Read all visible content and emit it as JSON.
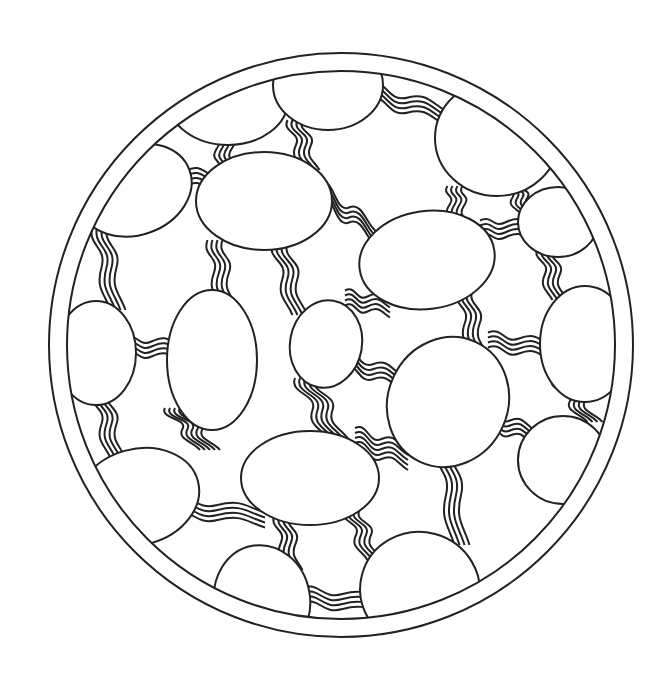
{
  "artwork": {
    "type": "coloring-page",
    "subject": "circular mandala of ovals connected by wavy line bundles",
    "stroke_color": "#222222",
    "background_color": "#ffffff",
    "stroke_width": 2,
    "center": [
      341,
      345
    ],
    "outer_ring_radius": 292,
    "inner_ring_radius": 274
  },
  "ovals": [
    {
      "cx": 228,
      "cy": 100,
      "rx": 60,
      "ry": 45,
      "rot": 0
    },
    {
      "cx": 328,
      "cy": 85,
      "rx": 55,
      "ry": 45,
      "rot": 0
    },
    {
      "cx": 497,
      "cy": 138,
      "rx": 62,
      "ry": 58,
      "rot": 0
    },
    {
      "cx": 135,
      "cy": 190,
      "rx": 58,
      "ry": 45,
      "rot": -20
    },
    {
      "cx": 264,
      "cy": 201,
      "rx": 68,
      "ry": 49,
      "rot": 0
    },
    {
      "cx": 427,
      "cy": 260,
      "rx": 68,
      "ry": 49,
      "rot": -8
    },
    {
      "cx": 558,
      "cy": 222,
      "rx": 40,
      "ry": 35,
      "rot": 0
    },
    {
      "cx": 96,
      "cy": 353,
      "rx": 40,
      "ry": 52,
      "rot": 0
    },
    {
      "cx": 212,
      "cy": 360,
      "rx": 45,
      "ry": 70,
      "rot": 0
    },
    {
      "cx": 326,
      "cy": 344,
      "rx": 36,
      "ry": 44,
      "rot": 10
    },
    {
      "cx": 448,
      "cy": 402,
      "rx": 60,
      "ry": 66,
      "rot": 25
    },
    {
      "cx": 585,
      "cy": 344,
      "rx": 45,
      "ry": 58,
      "rot": 0
    },
    {
      "cx": 138,
      "cy": 497,
      "rx": 62,
      "ry": 48,
      "rot": -15
    },
    {
      "cx": 310,
      "cy": 478,
      "rx": 69,
      "ry": 47,
      "rot": 0
    },
    {
      "cx": 563,
      "cy": 460,
      "rx": 45,
      "ry": 44,
      "rot": 0
    },
    {
      "cx": 262,
      "cy": 600,
      "rx": 48,
      "ry": 55,
      "rot": -10
    },
    {
      "cx": 420,
      "cy": 590,
      "rx": 60,
      "ry": 58,
      "rot": 15
    }
  ],
  "bundles": [
    {
      "x1": 262,
      "y1": 88,
      "x2": 280,
      "y2": 82,
      "count": 4,
      "dir": "h"
    },
    {
      "x1": 376,
      "y1": 90,
      "x2": 440,
      "y2": 120,
      "count": 4,
      "dir": "h"
    },
    {
      "x1": 222,
      "y1": 140,
      "x2": 228,
      "y2": 155,
      "count": 4,
      "dir": "v"
    },
    {
      "x1": 295,
      "y1": 130,
      "x2": 312,
      "y2": 160,
      "count": 4,
      "dir": "v"
    },
    {
      "x1": 170,
      "y1": 175,
      "x2": 200,
      "y2": 182,
      "count": 4,
      "dir": "h"
    },
    {
      "x1": 330,
      "y1": 190,
      "x2": 368,
      "y2": 240,
      "count": 4,
      "dir": "h"
    },
    {
      "x1": 510,
      "y1": 190,
      "x2": 530,
      "y2": 205,
      "count": 4,
      "dir": "v"
    },
    {
      "x1": 455,
      "y1": 196,
      "x2": 460,
      "y2": 212,
      "count": 4,
      "dir": "v"
    },
    {
      "x1": 490,
      "y1": 228,
      "x2": 520,
      "y2": 232,
      "count": 4,
      "dir": "h"
    },
    {
      "x1": 100,
      "y1": 235,
      "x2": 118,
      "y2": 300,
      "count": 4,
      "dir": "v"
    },
    {
      "x1": 215,
      "y1": 250,
      "x2": 228,
      "y2": 295,
      "count": 4,
      "dir": "v"
    },
    {
      "x1": 280,
      "y1": 252,
      "x2": 300,
      "y2": 305,
      "count": 4,
      "dir": "v"
    },
    {
      "x1": 545,
      "y1": 258,
      "x2": 560,
      "y2": 290,
      "count": 4,
      "dir": "v"
    },
    {
      "x1": 355,
      "y1": 298,
      "x2": 380,
      "y2": 310,
      "count": 4,
      "dir": "h"
    },
    {
      "x1": 465,
      "y1": 300,
      "x2": 480,
      "y2": 345,
      "count": 4,
      "dir": "v"
    },
    {
      "x1": 135,
      "y1": 346,
      "x2": 168,
      "y2": 352,
      "count": 4,
      "dir": "h"
    },
    {
      "x1": 498,
      "y1": 340,
      "x2": 540,
      "y2": 352,
      "count": 4,
      "dir": "h"
    },
    {
      "x1": 352,
      "y1": 358,
      "x2": 395,
      "y2": 385,
      "count": 4,
      "dir": "h"
    },
    {
      "x1": 100,
      "y1": 400,
      "x2": 118,
      "y2": 448,
      "count": 4,
      "dir": "v"
    },
    {
      "x1": 175,
      "y1": 418,
      "x2": 210,
      "y2": 440,
      "count": 5,
      "dir": "v"
    },
    {
      "x1": 305,
      "y1": 388,
      "x2": 340,
      "y2": 432,
      "count": 5,
      "dir": "v"
    },
    {
      "x1": 560,
      "y1": 390,
      "x2": 595,
      "y2": 412,
      "count": 4,
      "dir": "v"
    },
    {
      "x1": 365,
      "y1": 438,
      "x2": 398,
      "y2": 460,
      "count": 5,
      "dir": "h"
    },
    {
      "x1": 495,
      "y1": 418,
      "x2": 525,
      "y2": 438,
      "count": 4,
      "dir": "h"
    },
    {
      "x1": 180,
      "y1": 505,
      "x2": 255,
      "y2": 520,
      "count": 4,
      "dir": "h"
    },
    {
      "x1": 445,
      "y1": 455,
      "x2": 462,
      "y2": 535,
      "count": 4,
      "dir": "v"
    },
    {
      "x1": 282,
      "y1": 525,
      "x2": 295,
      "y2": 560,
      "count": 4,
      "dir": "v"
    },
    {
      "x1": 352,
      "y1": 520,
      "x2": 375,
      "y2": 550,
      "count": 4,
      "dir": "v"
    },
    {
      "x1": 310,
      "y1": 595,
      "x2": 375,
      "y2": 608,
      "count": 4,
      "dir": "h"
    }
  ]
}
